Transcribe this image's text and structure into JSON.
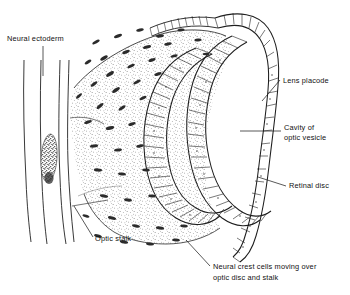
{
  "figure": {
    "style": "black-and-white stippled line drawing",
    "background_color": "#ffffff",
    "ink_color": "#1a1a1a"
  },
  "labels": {
    "neural_ectoderm": "Neural ectoderm",
    "optic_stalk": "Optic stalk",
    "lens_placode": "Lens placode",
    "cavity_line1": "Cavity of",
    "cavity_line2": "optic vesicle",
    "retinal_disc": "Retinal disc",
    "crest_line1": "Neural crest cells moving over",
    "crest_line2": "optic disc and stalk"
  },
  "structures": [
    {
      "name": "neural-ectoderm-tube",
      "description": "four near-vertical lines forming the neural tube wall with a dark stippled lumen oval"
    },
    {
      "name": "mesenchyme-stipple",
      "description": "stippled mass surrounding the optic vesicle"
    },
    {
      "name": "optic-stalk",
      "description": "narrow neck connecting neural tube to optic vesicle"
    },
    {
      "name": "retinal-disc-epithelium",
      "description": "inner U-shaped columnar epithelium (ladder pattern)"
    },
    {
      "name": "optic-vesicle-outer-wall",
      "description": "outer U-shaped columnar epithelium (ladder pattern)"
    },
    {
      "name": "lens-placode-epithelium",
      "description": "thickened surface ectoderm ladder at the right, curving over the top"
    },
    {
      "name": "neural-crest-cells",
      "description": "small dark elongated ovals scattered over the stalk and disc"
    }
  ]
}
